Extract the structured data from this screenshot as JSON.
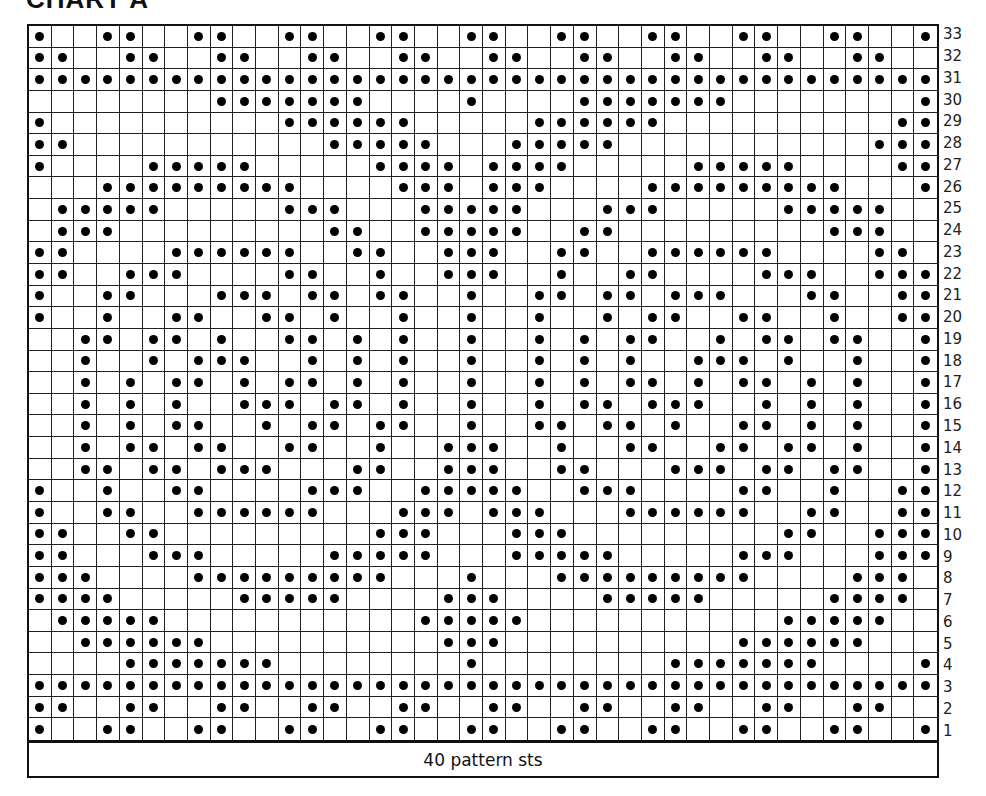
{
  "title": "CHART A",
  "footer_label": "40 pattern sts",
  "columns": 40,
  "legend": {
    "dot": "filled-dot-stitch",
    "empty": "blank-stitch"
  },
  "rows": [
    {
      "number": "33",
      "cells": "x..xx..xx..xx..xx..xx..xx..xx..xx..xx..x"
    },
    {
      "number": "32",
      "cells": "xx..xx..xx..xx..xx..xx..xx..xx..xx..xx.."
    },
    {
      "number": "31",
      "cells": "xxxxxxxxxxxxxxxxxxxxxxxxxxxxxxxxxxxxxxxx"
    },
    {
      "number": "30",
      "cells": "........xxxxxxx....x....xxxxxxx........x"
    },
    {
      "number": "29",
      "cells": "x..........xxxxxx.....xxxxxx..........xx"
    },
    {
      "number": "28",
      "cells": "xx...........xxxxx...xxxxx...........xxx"
    },
    {
      "number": "27",
      "cells": "x....xxxxx.....xxxx.xxxx.....xxxxx....xx"
    },
    {
      "number": "26",
      "cells": "...xxxxxxxxx....xxx.xxx....xxxxxxxxx...x"
    },
    {
      "number": "25",
      "cells": ".xxxxx.....xxx...xxxxx...xxx.....xxxxx.."
    },
    {
      "number": "24",
      "cells": ".xxx.........xx..xxxxx..xx.........xxx.."
    },
    {
      "number": "23",
      "cells": "xx....xxxxxx..xx..xxx..xx..xxxxxx....xx."
    },
    {
      "number": "22",
      "cells": "xx..xxx....xx..x..xxx..x..xx....xxx..xxx"
    },
    {
      "number": "21",
      "cells": "x..xx...xxx.xx.xx..x..xx.xx.xxx...xx..xx"
    },
    {
      "number": "20",
      "cells": "x..x..xx..xx.x..x..x..x..x.xx..xx..x..xx"
    },
    {
      "number": "19",
      "cells": "..xx.xx.x..xx.x.x..x..x.x.xx..x.xx.xx..x"
    },
    {
      "number": "18",
      "cells": "..x..x.xxx..x.x.x..x..x.x.x..xxx.x..x..x"
    },
    {
      "number": "17",
      "cells": "..x.x.xx.x.xx.x.x..x..x.x.xx.x.xx.x.x..x"
    },
    {
      "number": "16",
      "cells": "..x.x.x..xxx.xx.x..x..x.xx.xxx..x.x.x..x"
    },
    {
      "number": "15",
      "cells": "..x.x.xx..x.xx.xx..x..xx.xx.x..xx.x.x..x"
    },
    {
      "number": "14",
      "cells": "..x.xx.xx..xx..x..xxx..x..xx..xx.xx.x..x"
    },
    {
      "number": "13",
      "cells": "..xx.xx.xxx...xx..xxx..xx...xxx.xx.xx..x"
    },
    {
      "number": "12",
      "cells": "x..x..xx....xxx..xxxxx..xxx....xx..x..xx"
    },
    {
      "number": "11",
      "cells": "x..xx..xxxxxx...xxx.xxx...xxxxxx..xx..xx"
    },
    {
      "number": "10",
      "cells": "xx..xx.........xxx...xxx.........xx..xxx"
    },
    {
      "number": "9",
      "cells": "xx...xxx.....xxxxx...xxxxx.....xxx...xxx"
    },
    {
      "number": "8",
      "cells": "xxx....xxxxxxxxx...x...xxxxxxxxx....xxx."
    },
    {
      "number": "7",
      "cells": "xxxx.....xxxxx....xxx....xxxxx.....xxxx."
    },
    {
      "number": "6",
      "cells": ".xxxxx...........xxxxx...........xxxxx.."
    },
    {
      "number": "5",
      "cells": "..xxxxxx..........xxx..........xxxxxx..."
    },
    {
      "number": "4",
      "cells": "....xxxxxxx........x........xxxxxxx....x"
    },
    {
      "number": "3",
      "cells": "xxxxxxxxxxxxxxxxxxxxxxxxxxxxxxxxxxxxxxxx"
    },
    {
      "number": "2",
      "cells": "xx..xx..xx..xx..xx..xx..xx..xx..xx..xx.."
    },
    {
      "number": "1",
      "cells": "x..xx..xx..xx..xx..xx..xx..xx..xx..xx..x"
    }
  ]
}
